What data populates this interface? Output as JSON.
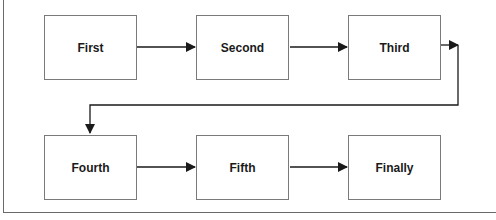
{
  "diagram": {
    "type": "flowchart",
    "nodes": [
      {
        "id": "first",
        "label": "First"
      },
      {
        "id": "second",
        "label": "Second"
      },
      {
        "id": "third",
        "label": "Third"
      },
      {
        "id": "fourth",
        "label": "Fourth"
      },
      {
        "id": "fifth",
        "label": "Fifth"
      },
      {
        "id": "finally",
        "label": "Finally"
      }
    ],
    "edges": [
      {
        "from": "First",
        "to": "Second"
      },
      {
        "from": "Second",
        "to": "Third"
      },
      {
        "from": "Third",
        "to": "Fourth"
      },
      {
        "from": "Fourth",
        "to": "Fifth"
      },
      {
        "from": "Fifth",
        "to": "Finally"
      }
    ],
    "colors": {
      "border": "#7a7a7a",
      "line": "#1a1a1a",
      "text": "#1a1a1a",
      "background": "#ffffff"
    }
  }
}
